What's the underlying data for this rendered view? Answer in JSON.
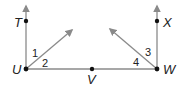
{
  "diagram": {
    "points": {
      "T": {
        "label": "T",
        "x": 26,
        "y": 21
      },
      "U": {
        "label": "U",
        "x": 26,
        "y": 69
      },
      "V": {
        "label": "V",
        "x": 92,
        "y": 69
      },
      "W": {
        "label": "W",
        "x": 157,
        "y": 69
      },
      "X": {
        "label": "X",
        "x": 157,
        "y": 21
      }
    },
    "angles": [
      {
        "label": "1"
      },
      {
        "label": "2"
      },
      {
        "label": "3"
      },
      {
        "label": "4"
      }
    ],
    "line_color": "#8a8a8a",
    "point_color": "#111111"
  }
}
